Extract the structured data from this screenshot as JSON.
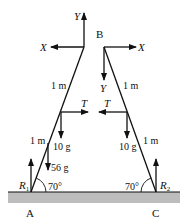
{
  "diagram": {
    "type": "force-diagram",
    "colors": {
      "line": "#111111",
      "ground": "#bdbdbd"
    },
    "points": {
      "A": "A",
      "B": "B",
      "C": "C"
    },
    "forces": {
      "left_top_y": "Y",
      "left_top_x": "X",
      "right_top_x": "X",
      "right_top_y": "Y",
      "left_tension": "T",
      "right_tension": "T",
      "left_weight": "10 g",
      "right_weight": "10 g",
      "load": "56 g",
      "reaction_left_base": "R",
      "reaction_left_sub": "1",
      "reaction_right_base": "R",
      "reaction_right_sub": "2"
    },
    "lengths": {
      "left_upper": "1 m",
      "left_lower": "1 m",
      "right_upper": "1 m",
      "right_lower": "1 m"
    },
    "angles": {
      "left": "70°",
      "right": "70°"
    }
  }
}
